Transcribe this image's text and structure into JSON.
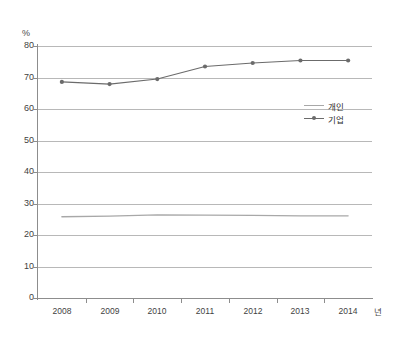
{
  "chart_data": {
    "type": "line",
    "title": "",
    "subtitle": "",
    "xlabel": "년",
    "ylabel": "%",
    "categories": [
      "2008",
      "2009",
      "2010",
      "2011",
      "2012",
      "2013",
      "2014"
    ],
    "x": [
      2008,
      2009,
      2010,
      2011,
      2012,
      2013,
      2014
    ],
    "series": [
      {
        "name": "개인",
        "color": "#a8a8a8",
        "marker": "none",
        "values": [
          25.8,
          26.0,
          26.4,
          26.3,
          26.2,
          26.1,
          26.1
        ]
      },
      {
        "name": "기업",
        "color": "#6b6b6b",
        "marker": "dot",
        "values": [
          68.6,
          67.9,
          69.5,
          73.5,
          74.6,
          75.4,
          75.4
        ]
      }
    ],
    "ylim": [
      0,
      80
    ],
    "yticks": [
      0,
      10,
      20,
      30,
      40,
      50,
      60,
      70,
      80
    ],
    "ytick_labels": [
      "0",
      "10",
      "20",
      "30",
      "40",
      "50",
      "60",
      "70",
      "80"
    ],
    "grid": true,
    "grid_axis": "y",
    "legend_position": "right-inside",
    "background": "#ffffff",
    "axis_color": "#8d8d8d",
    "grid_color": "#b8b8b8"
  },
  "legend": {
    "items": [
      {
        "label": "개인",
        "marker": "line"
      },
      {
        "label": "기업",
        "marker": "line-dot"
      }
    ]
  },
  "axis": {
    "y_unit": "%",
    "x_unit": "년"
  }
}
